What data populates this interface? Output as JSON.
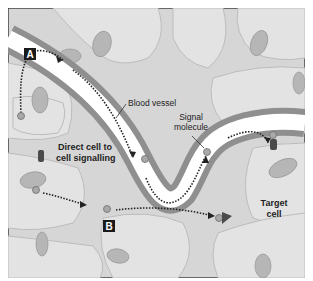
{
  "diagram": {
    "title": "Cell signalling",
    "labels": {
      "blood_vessel": "Blood vessel",
      "signal_molecule_1": "Signal",
      "signal_molecule_2": "molecule",
      "direct_1": "Direct cell to",
      "direct_2": "cell signalling",
      "target_1": "Target",
      "target_2": "cell",
      "marker_a": "A",
      "marker_b": "B"
    },
    "colors": {
      "background": "#d9d9d9",
      "cell_fill": "#e2e2e2",
      "cell_outline": "#bdbdbd",
      "nucleus": "#b5b5b5",
      "vessel_wall": "#8f8f8f",
      "vessel_lumen": "#ffffff",
      "marker": "#1a1a1a",
      "receptor": "#4a4a4a"
    }
  }
}
